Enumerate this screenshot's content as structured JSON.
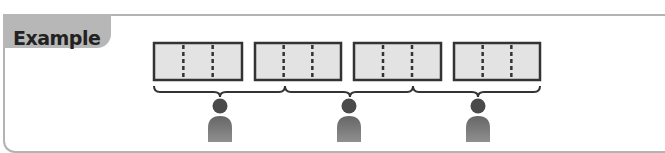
{
  "header": {
    "label": "Example"
  },
  "colors": {
    "frame": "#b3b3b3",
    "tab_fill": "#b7b7b7",
    "box_fill": "#e3e3e3",
    "box_stroke": "#333333",
    "person_head": "#4a4a4a",
    "person_body": "#7d7d7d"
  },
  "diagram": {
    "boxes": [
      {
        "x": 154,
        "y": 43,
        "w": 88,
        "h": 37,
        "dividers": 2
      },
      {
        "x": 255,
        "y": 43,
        "w": 86,
        "h": 37,
        "dividers": 2
      },
      {
        "x": 354,
        "y": 43,
        "w": 87,
        "h": 37,
        "dividers": 2
      },
      {
        "x": 454,
        "y": 43,
        "w": 86,
        "h": 37,
        "dividers": 2
      }
    ],
    "braces": [
      {
        "x1": 154,
        "x2": 285,
        "peak": 220
      },
      {
        "x1": 285,
        "x2": 413,
        "peak": 350
      },
      {
        "x1": 413,
        "x2": 540,
        "peak": 478
      }
    ],
    "people": [
      {
        "cx": 220
      },
      {
        "cx": 349
      },
      {
        "cx": 478
      }
    ]
  }
}
